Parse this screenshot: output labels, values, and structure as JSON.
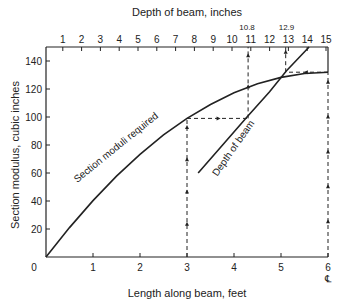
{
  "chart_data": {
    "type": "line",
    "title": "",
    "xlabel": "Length along beam, feet",
    "ylabel": "Section modulus, cubic inches",
    "x2label": "Depth of beam, inches",
    "xlim": [
      0,
      6
    ],
    "ylim": [
      0,
      150
    ],
    "x2lim": [
      0,
      15
    ],
    "x_ticks": [
      0,
      1,
      2,
      3,
      4,
      5,
      6
    ],
    "x_tick_labels": [
      "0",
      "1",
      "2",
      "3",
      "4",
      "5",
      "6"
    ],
    "y_ticks": [
      20,
      40,
      60,
      80,
      100,
      120,
      140
    ],
    "y_tick_labels": [
      "20",
      "40",
      "60",
      "80",
      "100",
      "120",
      "140"
    ],
    "x2_ticks": [
      1,
      2,
      3,
      4,
      5,
      6,
      7,
      8,
      9,
      10,
      11,
      12,
      13,
      14,
      15
    ],
    "x2_tick_labels": [
      "1",
      "2",
      "3",
      "4",
      "5",
      "6",
      "7",
      "8",
      "9",
      "10",
      "11",
      "12",
      "13",
      "14",
      "15"
    ],
    "x2_annotations": [
      {
        "value": 10.8,
        "label": "10.8"
      },
      {
        "value": 12.9,
        "label": "12.9"
      }
    ],
    "centerline_symbol": "℄",
    "grid": false,
    "series": [
      {
        "name": "Section moduli required",
        "axis": "bottom",
        "x": [
          0,
          0.5,
          1,
          1.5,
          2,
          2.5,
          3,
          3.5,
          4,
          4.5,
          5,
          5.5,
          6
        ],
        "y": [
          0,
          21,
          40.3,
          57.8,
          73.3,
          87.2,
          99,
          108.9,
          117.3,
          123.8,
          128.3,
          131.1,
          132
        ]
      },
      {
        "name": "Depth of beam",
        "axis": "top",
        "x": [
          8.2,
          9.5,
          10.8,
          12.0,
          12.9,
          14.1
        ],
        "y": [
          60,
          80,
          100,
          118,
          133,
          155
        ]
      }
    ],
    "guide_lines": [
      {
        "from": [
          3,
          0
        ],
        "to": [
          3,
          99
        ],
        "axis": "bottom",
        "style": "dashed-arrow-up"
      },
      {
        "from": [
          3,
          99
        ],
        "to": [
          4.3,
          99
        ],
        "axis": "bottom",
        "style": "dashed-arrow-right"
      },
      {
        "from": [
          4.3,
          99
        ],
        "to": [
          4.3,
          150
        ],
        "axis": "bottom",
        "style": "dashed-arrow-up",
        "top_value": 10.8
      },
      {
        "from": [
          6,
          0
        ],
        "to": [
          6,
          132
        ],
        "axis": "bottom",
        "style": "dashed-arrow-up"
      },
      {
        "from": [
          6,
          132
        ],
        "to": [
          5.1,
          132
        ],
        "axis": "bottom",
        "style": "dashed-arrow-left"
      },
      {
        "from": [
          5.1,
          132
        ],
        "to": [
          5.1,
          150
        ],
        "axis": "bottom",
        "style": "dashed-arrow-up",
        "top_value": 12.9
      }
    ]
  },
  "labels": {
    "xlabel": "Length along beam, feet",
    "ylabel": "Section modulus, cubic inches",
    "x2label": "Depth of beam, inches",
    "curve1": "Section moduli required",
    "curve2": "Depth of beam",
    "origin": "0"
  }
}
